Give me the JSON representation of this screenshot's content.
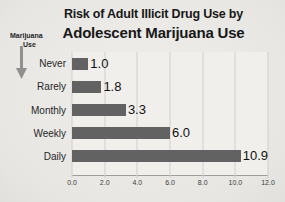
{
  "title": {
    "line1": "Risk of Adult Illicit Drug Use by",
    "line2": "Adolescent Marijuana Use"
  },
  "annotation": {
    "line1": "Marijuana",
    "line2": "Use",
    "icon": "down-arrow-icon",
    "arrow_color": "#909090"
  },
  "chart_data": {
    "type": "bar",
    "orientation": "horizontal",
    "title": "Risk of Adult Illicit Drug Use by Adolescent Marijuana Use",
    "categories": [
      "Never",
      "Rarely",
      "Monthly",
      "Weekly",
      "Daily"
    ],
    "values": [
      1.0,
      1.8,
      3.3,
      6.0,
      10.9
    ],
    "value_labels": [
      "1.0",
      "1.8",
      "3.3",
      "6.0",
      "10.9"
    ],
    "xlabel": "",
    "ylabel": "Marijuana Use",
    "xlim": [
      0,
      12
    ],
    "xticks": [
      0,
      2,
      4,
      6,
      8,
      10,
      12
    ],
    "xtick_labels": [
      "0.0",
      "2.0",
      "4.0",
      "6.0",
      "8.0",
      "10.0",
      "12.0"
    ],
    "grid": true,
    "legend": false,
    "bar_color": "#626262"
  },
  "colors": {
    "background": "#e9e8e5",
    "bar": "#626262",
    "gridline": "#d2d0cd",
    "axis": "#a09e9b",
    "title_text": "#181818"
  }
}
